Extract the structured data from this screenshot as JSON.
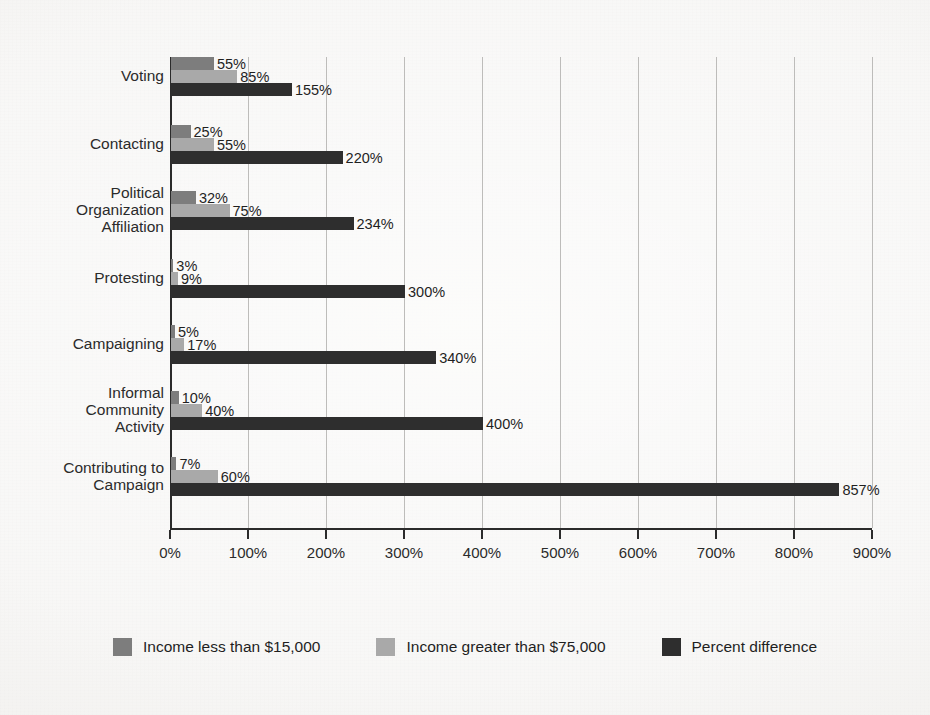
{
  "chart_data": {
    "type": "bar",
    "orientation": "horizontal",
    "title": "",
    "subtitle": "",
    "xlabel": "",
    "ylabel": "",
    "xlim": [
      0,
      900
    ],
    "grid": true,
    "legend_position": "bottom",
    "value_suffix": "%",
    "categories": [
      "Voting",
      "Contacting",
      "Political\nOrganization\nAffiliation",
      "Protesting",
      "Campaigning",
      "Informal\nCommunity\nActivity",
      "Contributing to\nCampaign"
    ],
    "series": [
      {
        "name": "Income less than $15,000",
        "color": "#7d7d7d",
        "values": [
          55,
          25,
          32,
          3,
          5,
          10,
          7
        ],
        "labels": [
          "55%",
          "25%",
          "32%",
          "3%",
          "5%",
          "10%",
          "7%"
        ]
      },
      {
        "name": "Income greater than $75,000",
        "color": "#a9a9a9",
        "values": [
          85,
          55,
          75,
          9,
          17,
          40,
          60
        ],
        "labels": [
          "85%",
          "55%",
          "75%",
          "9%",
          "17%",
          "40%",
          "60%"
        ]
      },
      {
        "name": "Percent difference",
        "color": "#2e2e2e",
        "values": [
          155,
          220,
          234,
          300,
          340,
          400,
          857
        ],
        "labels": [
          "155%",
          "220%",
          "234%",
          "300%",
          "340%",
          "400%",
          "857%"
        ]
      }
    ],
    "xticks": [
      0,
      100,
      200,
      300,
      400,
      500,
      600,
      700,
      800,
      900
    ],
    "xtick_labels": [
      "0%",
      "100%",
      "200%",
      "300%",
      "400%",
      "500%",
      "600%",
      "700%",
      "800%",
      "900%"
    ]
  },
  "legend": {
    "items": [
      {
        "label": "Income less than $15,000",
        "swatch": "legend-swatch-income-less-15000"
      },
      {
        "label": "Income greater than $75,000",
        "swatch": "legend-swatch-income-greater-75000"
      },
      {
        "label": "Percent difference",
        "swatch": "legend-swatch-percent-difference"
      }
    ]
  }
}
